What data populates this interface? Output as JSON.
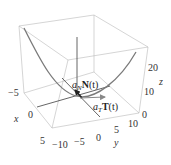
{
  "figure": {
    "type": "3d-space-curve",
    "curve_color": "#7a7a7a",
    "box_color": "#b8b8b8",
    "vector_color": "#222222",
    "tangent_vector_color": "#888888"
  },
  "axes": {
    "x": {
      "label": "x",
      "ticks": [
        "−5",
        "0",
        "5"
      ]
    },
    "y": {
      "label": "y",
      "ticks": [
        "−10",
        "−5",
        "0",
        "5",
        "10"
      ]
    },
    "z": {
      "label": "z",
      "ticks": [
        "0",
        "10",
        "20"
      ]
    }
  },
  "vectors": {
    "normal": {
      "coef": "a",
      "sub": "N",
      "vec": "N",
      "arg": "(t)"
    },
    "tangent": {
      "coef": "a",
      "sub": "T",
      "vec": "T",
      "arg": "(t)"
    }
  }
}
